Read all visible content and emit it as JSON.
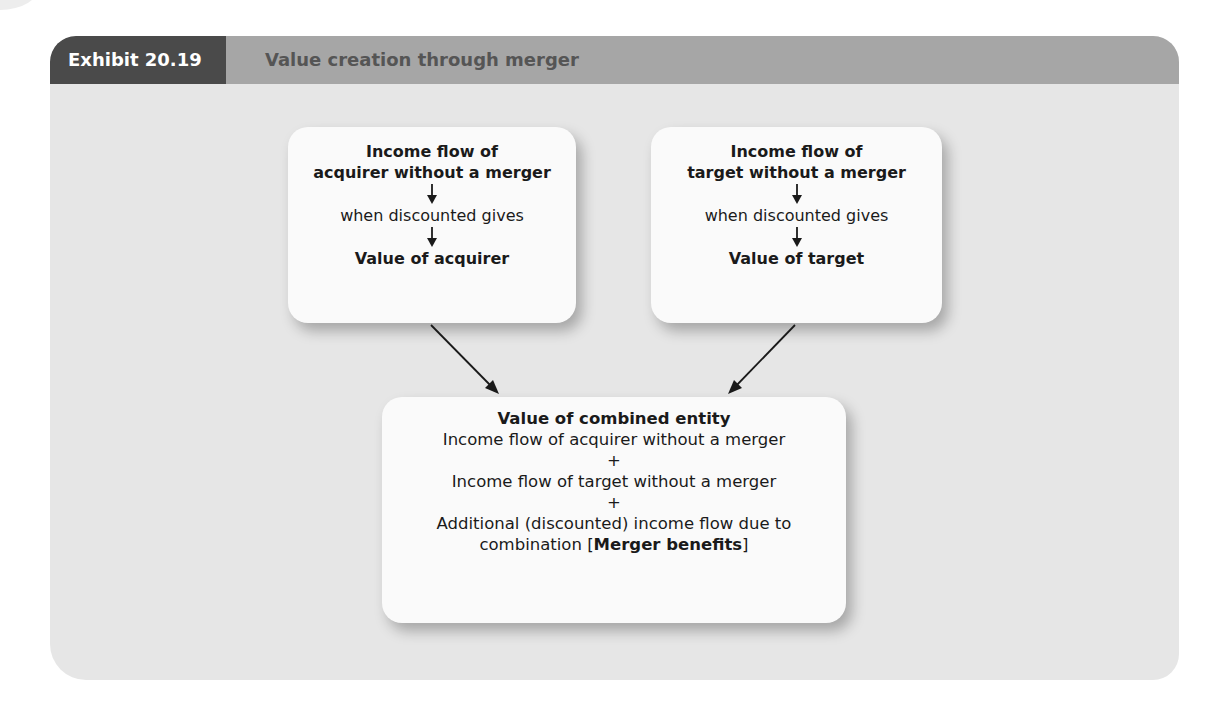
{
  "exhibit": {
    "label": "Exhibit 20.19",
    "title": "Value creation through merger"
  },
  "colors": {
    "panel_bg": "#e6e6e6",
    "header_bg": "#a6a6a6",
    "label_bg": "#4a4a4a",
    "box_bg": "#fafafa",
    "arrow": "#1a1a1a"
  },
  "boxes": {
    "acquirer": {
      "heading_line1": "Income flow of",
      "heading_line2": "acquirer without a merger",
      "step_arrow_icon": "down-arrow",
      "middle": "when discounted gives",
      "result": "Value of acquirer"
    },
    "target": {
      "heading_line1": "Income flow of",
      "heading_line2": "target without a merger",
      "step_arrow_icon": "down-arrow",
      "middle": "when discounted gives",
      "result": "Value of target"
    },
    "combined": {
      "heading": "Value of combined entity",
      "line1": "Income flow of acquirer without a merger",
      "plus1": "+",
      "line2": "Income flow of target without a merger",
      "plus2": "+",
      "line3": "Additional (discounted) income flow due to",
      "line4_prefix": "combination [",
      "line4_bold": "Merger benefits",
      "line4_suffix": "]"
    }
  },
  "connectors": [
    {
      "from": "acquirer",
      "to": "combined",
      "icon": "diagonal-arrow"
    },
    {
      "from": "target",
      "to": "combined",
      "icon": "diagonal-arrow"
    }
  ]
}
